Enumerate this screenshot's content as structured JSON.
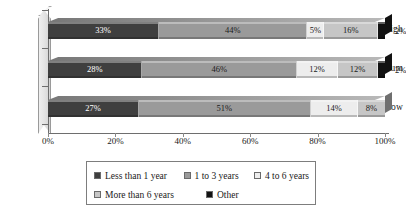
{
  "chart_data": {
    "type": "bar",
    "subtype": "stacked-horizontal-100",
    "title": "",
    "xlabel": "",
    "ylabel": "",
    "categories": [
      "High",
      "Medium",
      "Low"
    ],
    "xlim": [
      0,
      100
    ],
    "xticks": [
      "0%",
      "20%",
      "40%",
      "60%",
      "80%",
      "100%"
    ],
    "xtick_values": [
      0,
      20,
      40,
      60,
      80,
      100
    ],
    "grid": false,
    "legend_position": "bottom",
    "series": [
      {
        "name": "Less than 1 year",
        "color": "#3f3f3f",
        "values": [
          33,
          28,
          27
        ],
        "labels": [
          "33%",
          "28%",
          "27%"
        ]
      },
      {
        "name": "1 to 3 years",
        "color": "#9a9a9a",
        "values": [
          44,
          46,
          51
        ],
        "labels": [
          "44%",
          "46%",
          "51%"
        ]
      },
      {
        "name": "4 to 6 years",
        "color": "#ededed",
        "values": [
          5,
          12,
          14
        ],
        "labels": [
          "5%",
          "12%",
          "14%"
        ]
      },
      {
        "name": "More than 6 years",
        "color": "#c6c6c6",
        "values": [
          16,
          12,
          8
        ],
        "labels": [
          "16%",
          "12%",
          "8%"
        ]
      },
      {
        "name": "Other",
        "color": "#121212",
        "values": [
          2,
          2,
          0
        ],
        "labels": [
          "2%",
          "2%",
          ""
        ]
      }
    ],
    "rows": [
      {
        "category": "High",
        "segments": [
          {
            "series": "Less than 1 year",
            "value": 33,
            "label": "33%",
            "color": "#3f3f3f",
            "label_color": "#ffffff",
            "label_outside": false
          },
          {
            "series": "1 to 3 years",
            "value": 44,
            "label": "44%",
            "color": "#9a9a9a",
            "label_color": "#1a1a1a",
            "label_outside": false
          },
          {
            "series": "4 to 6 years",
            "value": 5,
            "label": "5%",
            "color": "#ededed",
            "label_color": "#1a1a1a",
            "label_outside": false
          },
          {
            "series": "More than 6 years",
            "value": 16,
            "label": "16%",
            "color": "#c6c6c6",
            "label_color": "#1a1a1a",
            "label_outside": false
          },
          {
            "series": "Other",
            "value": 2,
            "label": "2%",
            "color": "#121212",
            "label_color": "#1a1a1a",
            "label_outside": true
          }
        ]
      },
      {
        "category": "Medium",
        "segments": [
          {
            "series": "Less than 1 year",
            "value": 28,
            "label": "28%",
            "color": "#3f3f3f",
            "label_color": "#ffffff",
            "label_outside": false
          },
          {
            "series": "1 to 3 years",
            "value": 46,
            "label": "46%",
            "color": "#9a9a9a",
            "label_color": "#1a1a1a",
            "label_outside": false
          },
          {
            "series": "4 to 6 years",
            "value": 12,
            "label": "12%",
            "color": "#ededed",
            "label_color": "#1a1a1a",
            "label_outside": false
          },
          {
            "series": "More than 6 years",
            "value": 12,
            "label": "12%",
            "color": "#c6c6c6",
            "label_color": "#1a1a1a",
            "label_outside": false
          },
          {
            "series": "Other",
            "value": 2,
            "label": "2%",
            "color": "#121212",
            "label_color": "#1a1a1a",
            "label_outside": true
          }
        ]
      },
      {
        "category": "Low",
        "segments": [
          {
            "series": "Less than 1 year",
            "value": 27,
            "label": "27%",
            "color": "#3f3f3f",
            "label_color": "#ffffff",
            "label_outside": false
          },
          {
            "series": "1 to 3 years",
            "value": 51,
            "label": "51%",
            "color": "#9a9a9a",
            "label_color": "#1a1a1a",
            "label_outside": false
          },
          {
            "series": "4 to 6 years",
            "value": 14,
            "label": "14%",
            "color": "#ededed",
            "label_color": "#1a1a1a",
            "label_outside": false
          },
          {
            "series": "More than 6 years",
            "value": 8,
            "label": "8%",
            "color": "#c6c6c6",
            "label_color": "#1a1a1a",
            "label_outside": false
          },
          {
            "series": "Other",
            "value": 0,
            "label": "",
            "color": "#121212",
            "label_color": "#1a1a1a",
            "label_outside": true
          }
        ]
      }
    ],
    "legend": [
      {
        "label": "Less than 1 year",
        "color": "#3f3f3f"
      },
      {
        "label": "1 to 3 years",
        "color": "#9a9a9a"
      },
      {
        "label": "4 to 6 years",
        "color": "#ededed"
      },
      {
        "label": "More than 6 years",
        "color": "#c6c6c6"
      },
      {
        "label": "Other",
        "color": "#121212"
      }
    ]
  }
}
